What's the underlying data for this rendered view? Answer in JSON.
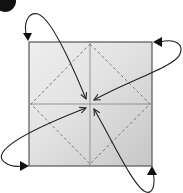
{
  "diagram": {
    "type": "origami-fold-instruction",
    "step": {
      "badge_visible": "partially cropped black circle",
      "number": ""
    },
    "paper": {
      "shape": "square",
      "x": 29,
      "y": 42,
      "width": 123,
      "height": 124,
      "center": [
        90,
        104
      ],
      "fill_light": "#ececec",
      "fill_dark": "#c9c9c9",
      "border_color": "#555555"
    },
    "creases": {
      "solid": [
        "vertical-center",
        "horizontal-center"
      ],
      "solid_color": "#8a8a8a",
      "dashed": "diamond connecting edge midpoints",
      "dashed_color": "#7a7a7a"
    },
    "arrows": [
      {
        "name": "top-left-corner-to-center",
        "from_corner": "top-left"
      },
      {
        "name": "top-right-corner-to-center",
        "from_corner": "top-right"
      },
      {
        "name": "bottom-left-corner-to-center",
        "from_corner": "bottom-left"
      },
      {
        "name": "bottom-right-corner-to-center",
        "from_corner": "bottom-right"
      }
    ],
    "arrow_color": "#222222"
  }
}
